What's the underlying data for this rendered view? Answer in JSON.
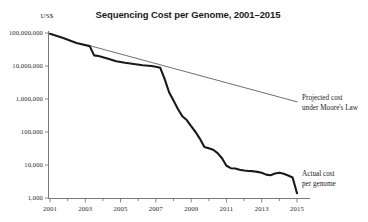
{
  "chart_data": {
    "type": "line",
    "title": "Sequencing Cost per Genome, 2001–2015",
    "unit_label": "US$",
    "xlabel": "",
    "ylabel": "US$",
    "yscale": "log",
    "ylim": [
      1000,
      100000000
    ],
    "xlim": [
      2001,
      2015
    ],
    "grid": false,
    "legend_position": "inline-annotations",
    "ytick_labels": [
      "100,000,000",
      "10,000,000",
      "1,000,000",
      "100,000",
      "10,000",
      "1,000"
    ],
    "ytick_values": [
      100000000,
      10000000,
      1000000,
      100000,
      10000,
      1000
    ],
    "xtick_labels": [
      "2001",
      "2003",
      "2005",
      "2007",
      "2009",
      "2011",
      "2013",
      "2015"
    ],
    "xtick_values": [
      2001,
      2003,
      2005,
      2007,
      2009,
      2011,
      2013,
      2015
    ],
    "xtick_minor_values": [
      2002,
      2004,
      2006,
      2008,
      2010,
      2012,
      2014
    ],
    "series": [
      {
        "name": "Actual cost per genome",
        "annotation": "Actual cost\nper genome",
        "annotation_line1": "Actual cost",
        "annotation_line2": "per genome",
        "color": "#191919",
        "x": [
          2001.0,
          2001.75,
          2002.5,
          2003.25,
          2003.5,
          2003.75,
          2004.25,
          2004.75,
          2005.25,
          2005.75,
          2006.25,
          2006.75,
          2007.0,
          2007.25,
          2007.5,
          2007.75,
          2008.0,
          2008.25,
          2008.5,
          2008.75,
          2009.0,
          2009.25,
          2009.5,
          2009.75,
          2010.0,
          2010.25,
          2010.5,
          2010.75,
          2011.0,
          2011.25,
          2011.5,
          2011.75,
          2012.0,
          2012.25,
          2012.5,
          2012.75,
          2013.0,
          2013.25,
          2013.5,
          2013.75,
          2014.0,
          2014.25,
          2014.5,
          2014.75,
          2015.0
        ],
        "y": [
          95000000,
          70000000,
          50000000,
          40000000,
          21000000,
          20000000,
          17000000,
          14000000,
          12500000,
          11500000,
          10500000,
          10000000,
          9500000,
          8800000,
          4000000,
          1600000,
          900000,
          500000,
          300000,
          230000,
          150000,
          100000,
          62000,
          35000,
          32000,
          29000,
          23000,
          16000,
          9500,
          8000,
          7800,
          7200,
          6800,
          6600,
          6500,
          6200,
          5800,
          5100,
          4900,
          5500,
          5800,
          5400,
          4800,
          4200,
          1400
        ]
      },
      {
        "name": "Projected cost under Moore's Law",
        "annotation": "Projected cost\nunder Moore's Law",
        "annotation_line1": "Projected cost",
        "annotation_line2": "under Moore's Law",
        "color": "#4a4a4a",
        "x": [
          2003.2,
          2015.0
        ],
        "y": [
          42000000,
          820000
        ]
      }
    ]
  },
  "annotations": {
    "moore_line1": "Projected cost",
    "moore_line2": "under Moore's Law",
    "actual_line1": "Actual cost",
    "actual_line2": "per genome"
  },
  "colors": {
    "actual_series": "#191919",
    "moore_series": "#4a4a4a",
    "axis": "#6a6a6a",
    "text": "#1b1b1b",
    "background": "#ffffff"
  }
}
